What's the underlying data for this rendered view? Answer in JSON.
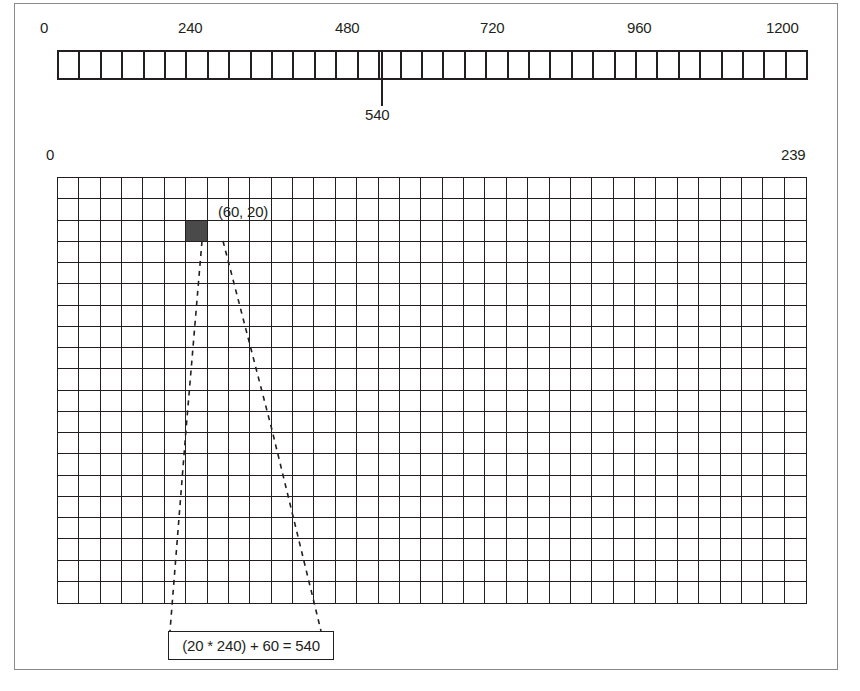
{
  "figure": {
    "colors": {
      "ink": "#231f20",
      "frame": "#8a8a8a",
      "shaded_cell": "#4a4a4a",
      "background": "#ffffff"
    }
  },
  "linear_array": {
    "name": "one-dimensional array strip",
    "cell_count": 35,
    "range_start": 0,
    "range_end": 1200,
    "tick_labels": [
      {
        "text": "0",
        "value": 0,
        "x": 40
      },
      {
        "text": "240",
        "value": 240,
        "x": 178
      },
      {
        "text": "480",
        "value": 480,
        "x": 335
      },
      {
        "text": "720",
        "value": 720,
        "x": 480
      },
      {
        "text": "960",
        "value": 960,
        "x": 627
      },
      {
        "text": "1200",
        "value": 1200,
        "x": 766
      }
    ],
    "pointer": {
      "label": "540",
      "value": 540,
      "cell_index": 16
    }
  },
  "grid": {
    "name": "two-dimensional grid",
    "columns": 35,
    "rows": 20,
    "corner_labels": [
      {
        "text": "0",
        "value": 0,
        "position": "top-left"
      },
      {
        "text": "239",
        "value": 239,
        "position": "top-right"
      }
    ],
    "highlighted_cell": {
      "label": "(60, 20)",
      "x": 60,
      "y": 20,
      "column_index": 6,
      "row_index": 2
    }
  },
  "formula": {
    "text": "(20 * 240) + 60 = 540",
    "row": 20,
    "width": 240,
    "column": 60,
    "result": 540
  },
  "chart_data": {
    "type": "diagram",
    "linear_axis_ticks": [
      0,
      240,
      480,
      720,
      960,
      1200
    ],
    "pointer_value": 540,
    "grid_dimensions": {
      "columns": 35,
      "rows": 20
    },
    "grid_corner_values": [
      0,
      239
    ],
    "highlighted_coordinate": [
      60,
      20
    ],
    "formula_expression": "(20 * 240) + 60 = 540"
  }
}
